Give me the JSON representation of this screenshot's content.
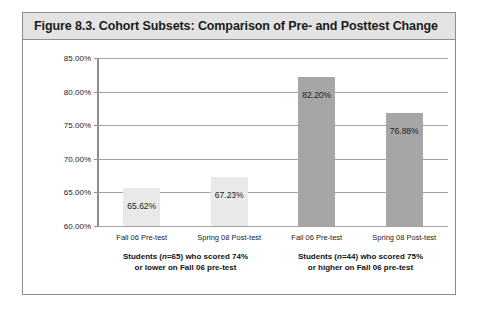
{
  "figure": {
    "title": "Figure 8.3.  Cohort Subsets: Comparison of Pre- and Posttest Change"
  },
  "chart_data": {
    "type": "bar",
    "title": "Figure 8.3.  Cohort Subsets: Comparison of Pre- and Posttest Change",
    "xlabel": "",
    "ylabel": "",
    "ylim": [
      60.0,
      85.0
    ],
    "grid": true,
    "legend": "none",
    "ytick_labels": [
      "85.00%",
      "80.00%",
      "75.00%",
      "70.00%",
      "65.00%",
      "60.00%"
    ],
    "ytick_values": [
      85.0,
      80.0,
      75.0,
      70.0,
      65.0,
      60.0
    ],
    "categories": [
      "Fall 06 Pre-test",
      "Spring 08 Post-test",
      "Fall 06 Pre-test",
      "Spring 08 Post-test"
    ],
    "values": [
      65.62,
      67.23,
      82.2,
      76.88
    ],
    "value_labels": [
      "65.62%",
      "67.23%",
      "82.20%",
      "76.88%"
    ],
    "bar_colors": [
      "#e9e9e9",
      "#e9e9e9",
      "#a6a6a6",
      "#a6a6a6"
    ],
    "groups": [
      {
        "caption_line1": "Students (n=65) who scored 74%",
        "caption_line2": "or lower on Fall 06 pre-test",
        "n": 65,
        "bar_indices": [
          0,
          1
        ]
      },
      {
        "caption_line1": "Students (n=44) who scored 75%",
        "caption_line2": "or higher on Fall 06 pre-test",
        "n": 44,
        "bar_indices": [
          2,
          3
        ]
      }
    ]
  },
  "colors": {
    "bar_light": "#e9e9e9",
    "bar_dark": "#a6a6a6",
    "gridline": "#a2a2a2",
    "frame_border": "#8d8d8d",
    "title_background": "#e3e3e3"
  }
}
